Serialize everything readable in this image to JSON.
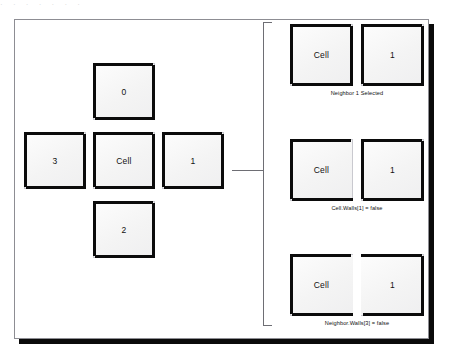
{
  "figure": {
    "title_artifact": "· · ·   ·   ·        ·     ·",
    "cross_diagram": {
      "center_label": "Cell",
      "neighbor_north": "0",
      "neighbor_east": "1",
      "neighbor_south": "2",
      "neighbor_west": "3"
    },
    "steps": [
      {
        "id": "step-neighbor-selected",
        "left_label": "Cell",
        "right_label": "1",
        "caption": "Neighbor 1 Selected",
        "left_walls": {
          "top": true,
          "right": true,
          "bottom": true,
          "left": true
        },
        "right_walls": {
          "top": true,
          "right": true,
          "bottom": true,
          "left": true
        }
      },
      {
        "id": "step-cell-wall-removed",
        "left_label": "Cell",
        "right_label": "1",
        "caption": "Cell.Walls[1] = false",
        "left_walls": {
          "top": true,
          "right": false,
          "bottom": true,
          "left": true
        },
        "right_walls": {
          "top": true,
          "right": true,
          "bottom": true,
          "left": true
        }
      },
      {
        "id": "step-neighbor-wall-removed",
        "left_label": "Cell",
        "right_label": "1",
        "caption": "Neighbor.Walls[3] = false",
        "left_walls": {
          "top": true,
          "right": false,
          "bottom": true,
          "left": true
        },
        "right_walls": {
          "top": true,
          "right": true,
          "bottom": true,
          "left": false
        }
      }
    ],
    "colors": {
      "wall": "#0b0b0b",
      "frame": "#8d8d93",
      "connector": "#6e6e74",
      "cell_fill": "#f4f4f4",
      "text": "#111111"
    }
  }
}
